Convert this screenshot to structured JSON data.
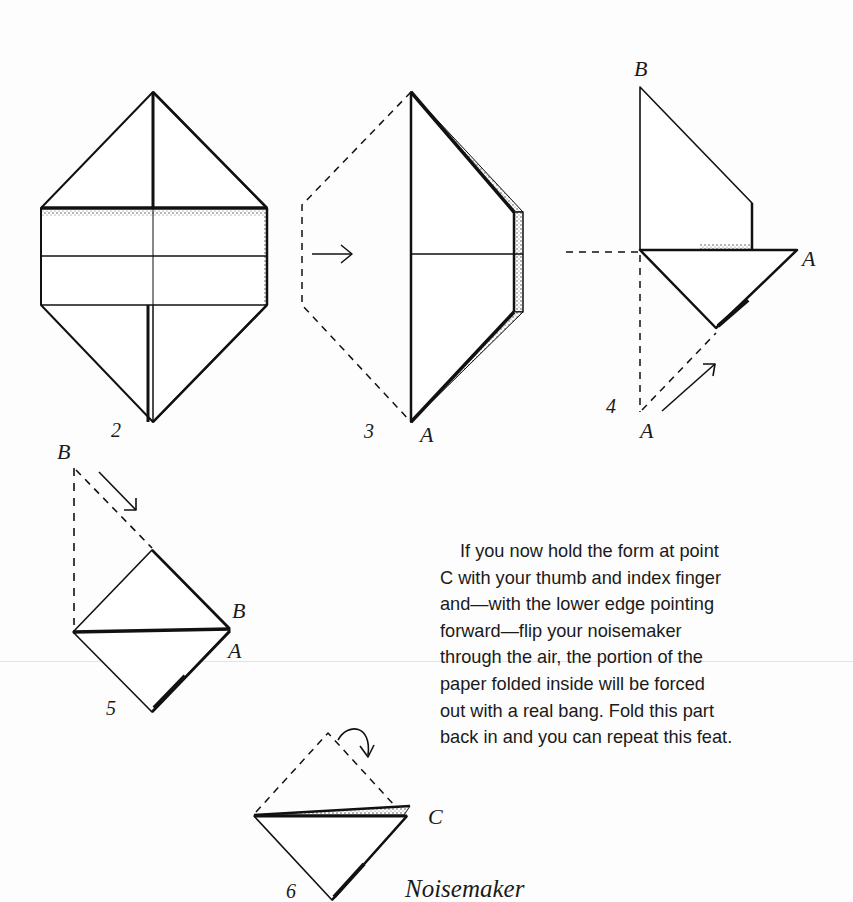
{
  "page": {
    "background": "#fdfdfd",
    "ink": "#1a1a1a"
  },
  "figures": [
    {
      "id": "2",
      "number_label": "2",
      "description": "Paper folded into elongated hexagon with horizontal band and center crease"
    },
    {
      "id": "3",
      "number_label": "3",
      "point_labels": [
        "A"
      ],
      "description": "Left half folded over to the right along center line (dashed outline shows original left side), arrow pointing right"
    },
    {
      "id": "4",
      "number_label": "4",
      "point_labels": [
        "B",
        "A",
        "A"
      ],
      "description": "Lower part folded upward; point A moved along dashed diagonal with arrow"
    },
    {
      "id": "5",
      "number_label": "5",
      "point_labels": [
        "B",
        "B",
        "A"
      ],
      "description": "Upper point B folded down to the right, forming a square"
    },
    {
      "id": "6",
      "number_label": "6",
      "point_labels": [
        "C"
      ],
      "description": "Top triangle folded back behind; hold at point C",
      "caption": "Noisemaker"
    }
  ],
  "labels": {
    "fig2_num": "2",
    "fig3_num": "3",
    "fig3_A": "A",
    "fig4_B": "B",
    "fig4_A_right": "A",
    "fig4_num": "4",
    "fig4_A_bottom": "A",
    "fig5_B_top": "B",
    "fig5_B_right": "B",
    "fig5_A_right": "A",
    "fig5_num": "5",
    "fig6_C": "C",
    "fig6_num": "6",
    "fig6_caption": "Noisemaker"
  },
  "instructions": {
    "paragraph": "If you now hold the form at point C with your thumb and index finger and—with the lower edge pointing forward—flip your noisemaker through the air, the portion of the paper folded inside will be forced out with a real bang. Fold this part back in and you can repeat this feat.",
    "lines": [
      "If you now hold the form at point",
      "C with your thumb and index finger",
      "and—with the lower edge pointing",
      "forward—flip your noisemaker",
      "through the air, the portion of the",
      "paper folded inside will be forced",
      "out with a real bang. Fold this part",
      "back in and you can repeat this feat."
    ]
  }
}
